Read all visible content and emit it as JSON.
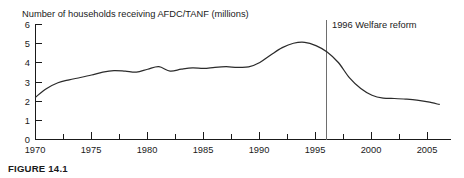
{
  "figure": {
    "caption": "FIGURE 14.1"
  },
  "chart_data": {
    "type": "line",
    "title": "Number of households receiving AFDC/TANF (millions)",
    "xlabel": "",
    "ylabel": "",
    "xlim": [
      1970,
      2007
    ],
    "ylim": [
      0,
      6
    ],
    "yticks": [
      0,
      1,
      2,
      3,
      4,
      5,
      6
    ],
    "ytick_labels": [
      "0",
      "1",
      "2",
      "3",
      "4",
      "5",
      "6"
    ],
    "xticks": [
      1970,
      1975,
      1980,
      1985,
      1990,
      1995,
      2000,
      2005
    ],
    "xtick_labels": [
      "1970",
      "1975",
      "1980",
      "1985",
      "1990",
      "1995",
      "2000",
      "2005"
    ],
    "x_minor_tick_interval": 2.5,
    "grid": false,
    "legend": "none",
    "series": [
      {
        "name": "Households receiving AFDC/TANF",
        "color": "#2b2b2b",
        "x": [
          1970,
          1971,
          1972,
          1973,
          1974,
          1975,
          1976,
          1977,
          1978,
          1979,
          1980,
          1981,
          1982,
          1983,
          1984,
          1985,
          1986,
          1987,
          1988,
          1989,
          1990,
          1991,
          1992,
          1993,
          1994,
          1995,
          1996,
          1997,
          1998,
          1999,
          2000,
          2001,
          2002,
          2003,
          2004,
          2005,
          2006
        ],
        "values": [
          2.2,
          2.65,
          2.95,
          3.1,
          3.22,
          3.35,
          3.5,
          3.58,
          3.55,
          3.5,
          3.65,
          3.78,
          3.55,
          3.65,
          3.72,
          3.69,
          3.75,
          3.78,
          3.75,
          3.77,
          4.0,
          4.4,
          4.77,
          5.0,
          5.05,
          4.88,
          4.55,
          4.0,
          3.2,
          2.65,
          2.3,
          2.15,
          2.13,
          2.1,
          2.05,
          1.95,
          1.82
        ]
      }
    ],
    "annotations": [
      {
        "label": "1996 Welfare reform",
        "x": 1996,
        "type": "vertical-line",
        "color": "#6e6e6e"
      }
    ]
  }
}
